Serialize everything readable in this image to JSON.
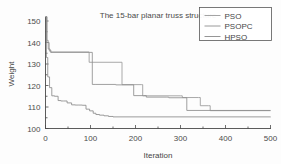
{
  "chart_data": {
    "type": "line",
    "title": "The 15-bar planar truss structure",
    "xlabel": "Iteration",
    "ylabel": "Weight",
    "xlim": [
      0,
      500
    ],
    "ylim": [
      100,
      150
    ],
    "xticks": [
      0,
      100,
      200,
      300,
      400,
      500
    ],
    "yticks": [
      100,
      110,
      120,
      130,
      140,
      150
    ],
    "xtick_labels": [
      "0",
      "100",
      "200",
      "300",
      "400",
      "500"
    ],
    "ytick_labels": [
      "100",
      "110",
      "120",
      "130",
      "140",
      "150"
    ],
    "grid": false,
    "legend_position": "top-right",
    "legend_entries": [
      "PSO",
      "PSOPC",
      "HPSO"
    ],
    "series": [
      {
        "name": "PSO",
        "color": "#9a9a9a",
        "step": "post",
        "x": [
          0,
          3,
          6,
          10,
          95,
          97,
          168,
          170,
          214,
          216,
          300,
          304,
          340,
          344,
          362,
          366,
          500
        ],
        "y": [
          152.0,
          141.0,
          137.0,
          135.6,
          135.6,
          130.8,
          130.8,
          120.4,
          120.4,
          115.2,
          115.2,
          114.4,
          114.4,
          110.6,
          110.6,
          108.3,
          108.3
        ]
      },
      {
        "name": "PSOPC",
        "color": "#8e8e8e",
        "step": "post",
        "x": [
          0,
          3,
          8,
          12,
          98,
          104,
          112,
          150,
          156,
          190,
          196,
          218,
          224,
          268,
          274,
          308,
          314,
          500
        ],
        "y": [
          152.0,
          140.0,
          136.4,
          135.4,
          135.4,
          120.5,
          120.5,
          120.5,
          120.3,
          120.3,
          115.3,
          115.3,
          114.6,
          114.6,
          114.3,
          114.3,
          108.4,
          108.4
        ]
      },
      {
        "name": "HPSO",
        "color": "#8a8a8a",
        "step": "post",
        "x": [
          0,
          2,
          5,
          9,
          14,
          20,
          28,
          34,
          40,
          48,
          58,
          66,
          74,
          82,
          90,
          98,
          106,
          112,
          120,
          130,
          140,
          150,
          500
        ],
        "y": [
          152.0,
          133.0,
          124.0,
          119.0,
          115.2,
          115.0,
          113.0,
          112.8,
          112.8,
          111.9,
          111.0,
          110.9,
          110.9,
          110.8,
          109.0,
          108.2,
          107.1,
          106.5,
          106.2,
          105.9,
          105.6,
          105.4,
          105.3
        ]
      }
    ]
  },
  "figure": {
    "background": "#fdfdfd",
    "axis_color": "#4a4a4a"
  }
}
